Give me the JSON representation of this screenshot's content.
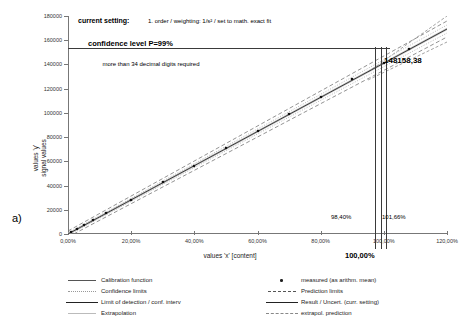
{
  "panel": {
    "label": "a)"
  },
  "annotations": {
    "current_setting_label": "current setting:",
    "current_setting_value": "1. order / weighting: 1/s² / set to math. exact fit",
    "confidence_level": "confidence level P=99%",
    "decimal_note": "more than 34 decimal digits required",
    "result_value": "148158,38",
    "lower_pct": "98,40%",
    "upper_pct": "101,66%",
    "center_pct": "100,00%"
  },
  "legend": {
    "items": [
      {
        "label": "Calibration function",
        "key": "solid-thin",
        "col": 0
      },
      {
        "label": "measured (as arithm. mean)",
        "key": "dot-marker",
        "col": 1
      },
      {
        "label": "Confidence limits",
        "key": "dotted",
        "col": 0
      },
      {
        "label": "Prediction limits",
        "key": "dashed-long",
        "col": 1
      },
      {
        "label": "Limit of detection / conf. interv",
        "key": "solid-thick",
        "col": 0
      },
      {
        "label": "Result / Uncert. (curr. setting)",
        "key": "solid-thick",
        "col": 1
      },
      {
        "label": "Extrapolation",
        "key": "faint",
        "col": 0
      },
      {
        "label": "extrapol. prediction",
        "key": "dash-dot",
        "col": 1
      }
    ]
  },
  "chart_data": {
    "type": "line",
    "title": "",
    "xlabel": "values 'x' [content]",
    "ylabel": "values 'y'\nsignal values",
    "xlim": [
      0,
      120
    ],
    "ylim": [
      0,
      180000
    ],
    "grid": false,
    "legend_position": "bottom",
    "x_ticks": [
      "0,00%",
      "20,00%",
      "40,00%",
      "60,00%",
      "80,00%",
      "100,00%",
      "120,00%"
    ],
    "x_tick_values": [
      0,
      20,
      40,
      60,
      80,
      100,
      120
    ],
    "y_ticks": [
      "0",
      "20000",
      "40000",
      "60000",
      "80000",
      "100000",
      "120000",
      "140000",
      "160000",
      "180000"
    ],
    "y_tick_values": [
      0,
      20000,
      40000,
      60000,
      80000,
      100000,
      120000,
      140000,
      160000,
      180000
    ],
    "series": [
      {
        "name": "Calibration function",
        "type": "line",
        "x": [
          0,
          110
        ],
        "y": [
          0,
          163000
        ]
      },
      {
        "name": "measured (as arithm. mean)",
        "type": "scatter",
        "x": [
          1,
          3,
          5,
          8,
          12,
          20,
          30,
          40,
          50,
          60,
          70,
          80,
          90,
          100,
          108
        ],
        "y": [
          1480,
          4450,
          7410,
          11850,
          17780,
          29630,
          44450,
          59260,
          74080,
          88900,
          103710,
          118530,
          133340,
          148158,
          160000
        ]
      },
      {
        "name": "Result / Uncert. (curr. setting)",
        "type": "hline",
        "y": 148158.38
      },
      {
        "name": "Uncertainty interval",
        "type": "vlines",
        "x": [
          98.4,
          100.0,
          101.66
        ]
      }
    ],
    "result": {
      "x_pct": 100.0,
      "y_value": 148158.38,
      "x_lower_pct": 98.4,
      "x_upper_pct": 101.66
    }
  }
}
